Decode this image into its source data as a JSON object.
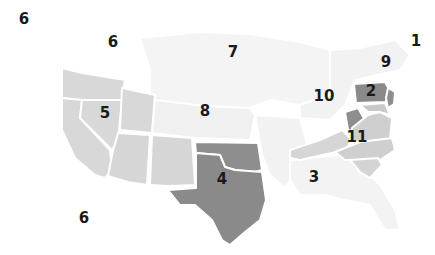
{
  "map": {
    "title": "US circuit regions",
    "colors": {
      "faint": "#f3f3f3",
      "light": "#d9d9d9",
      "mid": "#c8c8c8",
      "dark": "#8f8f8f",
      "darker": "#7d7d7d",
      "border": "#ffffff",
      "label": "#1a1a1a"
    },
    "labels": [
      {
        "id": "label-6-pacific-1",
        "text": "6",
        "x": 24,
        "y": 19
      },
      {
        "id": "label-6-pacific-2",
        "text": "6",
        "x": 113,
        "y": 42
      },
      {
        "id": "label-7",
        "text": "7",
        "x": 233,
        "y": 52
      },
      {
        "id": "label-1",
        "text": "1",
        "x": 416,
        "y": 41
      },
      {
        "id": "label-9",
        "text": "9",
        "x": 386,
        "y": 62
      },
      {
        "id": "label-10",
        "text": "10",
        "x": 324,
        "y": 96
      },
      {
        "id": "label-2",
        "text": "2",
        "x": 371,
        "y": 91
      },
      {
        "id": "label-5",
        "text": "5",
        "x": 105,
        "y": 113
      },
      {
        "id": "label-8",
        "text": "8",
        "x": 205,
        "y": 111
      },
      {
        "id": "label-11",
        "text": "11",
        "x": 357,
        "y": 137
      },
      {
        "id": "label-4",
        "text": "4",
        "x": 222,
        "y": 179
      },
      {
        "id": "label-3",
        "text": "3",
        "x": 314,
        "y": 177
      },
      {
        "id": "label-6-south",
        "text": "6",
        "x": 84,
        "y": 218
      }
    ]
  }
}
